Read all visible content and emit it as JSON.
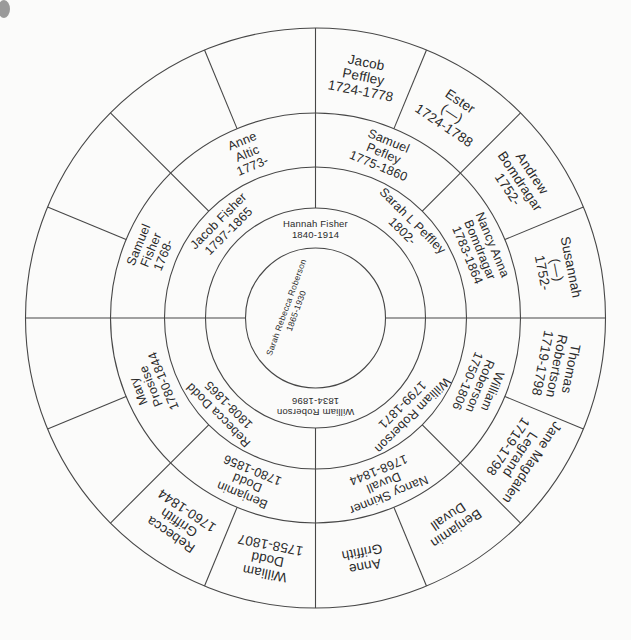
{
  "chart": {
    "type_note": "circular genealogy fan chart, scanned document",
    "colors": {
      "background": "#fbfbfa",
      "line": "#474747",
      "text": "#2a2a2a"
    },
    "people": [
      {
        "id": "sarah-rebecca-roberson",
        "ring": 0,
        "lines": [
          "Sarah Rebecca Roberson",
          "1865-1930"
        ]
      },
      {
        "id": "hannah-fisher",
        "ring": 1,
        "start_deg": 0,
        "end_deg": 180,
        "lines": [
          "Hannah Fisher",
          "1840-1914"
        ]
      },
      {
        "id": "william-roberson-1834",
        "ring": 1,
        "start_deg": 180,
        "end_deg": 360,
        "lines": [
          "William Roberson",
          "1834-1896"
        ]
      },
      {
        "id": "jacob-fisher",
        "ring": 2,
        "start_deg": 90,
        "end_deg": 180,
        "lines": [
          "Jacob Fisher",
          "1797-1865"
        ]
      },
      {
        "id": "sarah-l-peffley",
        "ring": 2,
        "start_deg": 0,
        "end_deg": 90,
        "lines": [
          "Sarah L Peffley",
          "1802-"
        ]
      },
      {
        "id": "rebecca-dodd",
        "ring": 2,
        "start_deg": 180,
        "end_deg": 270,
        "lines": [
          "Rebecca Dodd",
          "1808-1865"
        ]
      },
      {
        "id": "william-roberson-1799",
        "ring": 2,
        "start_deg": 270,
        "end_deg": 360,
        "lines": [
          "William Roberson",
          "1799-1871"
        ]
      },
      {
        "id": "samuel-fisher",
        "ring": 3,
        "start_deg": 135,
        "end_deg": 180,
        "lines": [
          "Samuel",
          "Fisher",
          "1768-"
        ]
      },
      {
        "id": "anne-altic",
        "ring": 3,
        "start_deg": 90,
        "end_deg": 135,
        "lines": [
          "Anne",
          "Altic",
          "1773-"
        ]
      },
      {
        "id": "samuel-pefley",
        "ring": 3,
        "start_deg": 45,
        "end_deg": 90,
        "lines": [
          "Samuel",
          "Pefley",
          "1775-1860"
        ]
      },
      {
        "id": "nancy-anna-bomdragar",
        "ring": 3,
        "start_deg": 0,
        "end_deg": 45,
        "lines": [
          "Nancy Anna",
          "Bomdragar",
          "1783-1864"
        ]
      },
      {
        "id": "mary-prosise",
        "ring": 3,
        "start_deg": 180,
        "end_deg": 225,
        "lines": [
          "Mary",
          "Prosise",
          "1780-1844"
        ]
      },
      {
        "id": "benjamin-dodd",
        "ring": 3,
        "start_deg": 225,
        "end_deg": 270,
        "lines": [
          "Benjamin",
          "Dodd",
          "1780-1856"
        ]
      },
      {
        "id": "nancy-skinner-duvall",
        "ring": 3,
        "start_deg": 270,
        "end_deg": 315,
        "lines": [
          "Nancy Skinner",
          "Duvall",
          "1768-1844"
        ]
      },
      {
        "id": "william-roberson-1750",
        "ring": 3,
        "start_deg": 315,
        "end_deg": 360,
        "lines": [
          "William",
          "Roberson",
          "1750-1806"
        ]
      },
      {
        "id": "jacob-peffley",
        "ring": 4,
        "start_deg": 67.5,
        "end_deg": 90,
        "lines": [
          "Jacob",
          "Peffley",
          "1724-1778"
        ]
      },
      {
        "id": "ester",
        "ring": 4,
        "start_deg": 45,
        "end_deg": 67.5,
        "lines": [
          "Ester",
          "(—)",
          "1724-1788"
        ]
      },
      {
        "id": "andrew-bomdragar",
        "ring": 4,
        "start_deg": 22.5,
        "end_deg": 45,
        "lines": [
          "Andrew",
          "Bomdragar",
          "1752-"
        ]
      },
      {
        "id": "susannah",
        "ring": 4,
        "start_deg": 0,
        "end_deg": 22.5,
        "lines": [
          "Susannah",
          "(—)",
          "1752-"
        ]
      },
      {
        "id": "thomas-robertson",
        "ring": 4,
        "start_deg": 337.5,
        "end_deg": 360,
        "lines": [
          "Thomas",
          "Robertson",
          "1719-1798"
        ]
      },
      {
        "id": "jane-magdalen-legrand",
        "ring": 4,
        "start_deg": 315,
        "end_deg": 337.5,
        "lines": [
          "Jane Magdalen",
          "Legrand",
          "1719-1798"
        ]
      },
      {
        "id": "benjamin-duvall",
        "ring": 4,
        "start_deg": 292.5,
        "end_deg": 315,
        "lines": [
          "Benjamin",
          "Duvall"
        ]
      },
      {
        "id": "anne-griffith",
        "ring": 4,
        "start_deg": 270,
        "end_deg": 292.5,
        "lines": [
          "Anne",
          "Griffith"
        ]
      },
      {
        "id": "william-dodd",
        "ring": 4,
        "start_deg": 247.5,
        "end_deg": 270,
        "lines": [
          "William",
          "Dodd",
          "1758-1807"
        ]
      },
      {
        "id": "rebecca-griffith",
        "ring": 4,
        "start_deg": 225,
        "end_deg": 247.5,
        "lines": [
          "Rebecca",
          "Griffith",
          "1760-1844"
        ]
      }
    ],
    "empty_sectors_ring4": [
      {
        "start_deg": 157.5,
        "end_deg": 180
      },
      {
        "start_deg": 135,
        "end_deg": 157.5
      },
      {
        "start_deg": 112.5,
        "end_deg": 135
      },
      {
        "start_deg": 90,
        "end_deg": 112.5
      },
      {
        "start_deg": 180,
        "end_deg": 202.5
      },
      {
        "start_deg": 202.5,
        "end_deg": 225
      }
    ]
  }
}
